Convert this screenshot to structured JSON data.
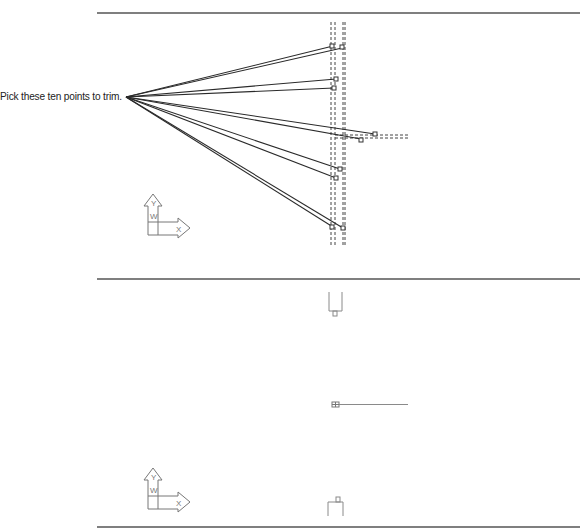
{
  "annotation": {
    "callout_text": "Pick these ten points to trim."
  },
  "panels": [
    {
      "name": "before",
      "description": "Lines converging at a single point, crossing two dashed vertical cutting edges; ten pick boxes mark trim points",
      "ucs_icon": {
        "y_label": "Y",
        "x_label": "X",
        "w_label": "W"
      }
    },
    {
      "name": "after",
      "description": "Result after trimming: short stubs remain at top, middle and bottom",
      "ucs_icon": {
        "y_label": "Y",
        "x_label": "X",
        "w_label": "W"
      }
    }
  ],
  "colors": {
    "line": "#2a2a2a",
    "separator": "#555555",
    "dashed": "#444444",
    "light_line": "#8a8a8a",
    "icon": "#777777"
  }
}
